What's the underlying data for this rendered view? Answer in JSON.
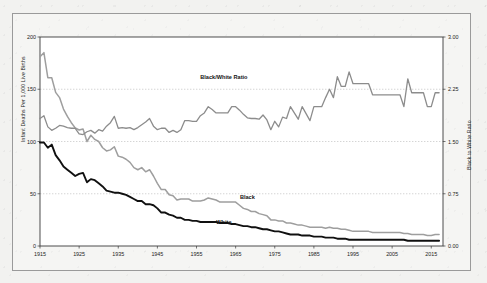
{
  "figure": {
    "background_color": "#f2f2f0",
    "plot_background_color": "#ffffff",
    "frame_color": "#9a9a9a"
  },
  "chart_data": {
    "type": "line",
    "title": "",
    "xlabel": "",
    "ylabel": "Infant Deaths Per 1,000 Live Births",
    "y2label": "Black to White Ratio",
    "xlim": [
      1915,
      2018
    ],
    "ylim": [
      0,
      200
    ],
    "y2lim": [
      0.0,
      3.0
    ],
    "grid": true,
    "grid_style": "dotted-horizontal",
    "legend": "inline-annotations",
    "xticks": [
      1915,
      1925,
      1935,
      1945,
      1955,
      1965,
      1975,
      1985,
      1995,
      2005,
      2015
    ],
    "yticks": [
      0,
      50,
      100,
      150,
      200
    ],
    "y2ticks": [
      "0.00",
      "0.75",
      "1.50",
      "2.25",
      "3.00"
    ],
    "annotations": [
      {
        "text": "Black/White Ratio",
        "x": 1962,
        "y_axis": "right",
        "value": 2.32
      },
      {
        "text": "Black",
        "x": 1968,
        "y_axis": "left",
        "value": 40
      },
      {
        "text": "White",
        "x": 1962,
        "y_axis": "left",
        "value": 16
      }
    ],
    "series": [
      {
        "name": "Black",
        "axis": "left",
        "color": "#9e9e9e",
        "width": 1.5,
        "x": [
          1915,
          1916,
          1917,
          1918,
          1919,
          1920,
          1921,
          1922,
          1923,
          1924,
          1925,
          1926,
          1927,
          1928,
          1929,
          1930,
          1931,
          1932,
          1933,
          1934,
          1935,
          1936,
          1937,
          1938,
          1939,
          1940,
          1941,
          1942,
          1943,
          1944,
          1945,
          1946,
          1947,
          1948,
          1949,
          1950,
          1951,
          1952,
          1953,
          1954,
          1955,
          1956,
          1957,
          1958,
          1959,
          1960,
          1961,
          1962,
          1963,
          1964,
          1965,
          1966,
          1967,
          1968,
          1969,
          1970,
          1971,
          1972,
          1973,
          1974,
          1975,
          1976,
          1977,
          1978,
          1979,
          1980,
          1981,
          1982,
          1983,
          1984,
          1985,
          1986,
          1987,
          1988,
          1989,
          1990,
          1991,
          1992,
          1993,
          1994,
          1995,
          1996,
          1997,
          1998,
          1999,
          2000,
          2001,
          2002,
          2003,
          2004,
          2005,
          2006,
          2007,
          2008,
          2009,
          2010,
          2011,
          2012,
          2013,
          2014,
          2015,
          2016,
          2017
        ],
        "values": [
          181,
          185,
          161,
          161,
          147,
          142,
          131,
          124,
          118,
          113,
          111,
          112,
          100,
          106,
          102,
          100,
          94,
          91,
          92,
          95,
          86,
          85,
          83,
          80,
          75,
          73,
          75,
          71,
          73,
          67,
          60,
          54,
          54,
          49,
          48,
          44,
          45,
          45,
          45,
          43,
          43,
          43,
          44,
          46,
          45,
          44,
          42,
          42,
          42,
          42,
          42,
          39,
          36,
          35,
          33,
          33,
          31,
          30,
          29,
          25,
          25,
          24,
          24,
          22,
          22,
          21,
          20,
          20,
          19,
          18,
          18,
          18,
          18,
          17,
          18,
          17,
          17,
          16,
          16,
          15,
          14,
          14,
          14,
          14,
          14,
          13,
          13,
          13,
          13,
          13,
          13,
          13,
          13,
          12,
          12,
          11,
          11,
          11,
          11,
          10,
          10,
          11,
          11
        ]
      },
      {
        "name": "White",
        "axis": "left",
        "color": "#101010",
        "width": 1.9,
        "x": [
          1915,
          1916,
          1917,
          1918,
          1919,
          1920,
          1921,
          1922,
          1923,
          1924,
          1925,
          1926,
          1927,
          1928,
          1929,
          1930,
          1931,
          1932,
          1933,
          1934,
          1935,
          1936,
          1937,
          1938,
          1939,
          1940,
          1941,
          1942,
          1943,
          1944,
          1945,
          1946,
          1947,
          1948,
          1949,
          1950,
          1951,
          1952,
          1953,
          1954,
          1955,
          1956,
          1957,
          1958,
          1959,
          1960,
          1961,
          1962,
          1963,
          1964,
          1965,
          1966,
          1967,
          1968,
          1969,
          1970,
          1971,
          1972,
          1973,
          1974,
          1975,
          1976,
          1977,
          1978,
          1979,
          1980,
          1981,
          1982,
          1983,
          1984,
          1985,
          1986,
          1987,
          1988,
          1989,
          1990,
          1991,
          1992,
          1993,
          1994,
          1995,
          1996,
          1997,
          1998,
          1999,
          2000,
          2001,
          2002,
          2003,
          2004,
          2005,
          2006,
          2007,
          2008,
          2009,
          2010,
          2011,
          2012,
          2013,
          2014,
          2015,
          2016,
          2017
        ],
        "values": [
          99,
          99,
          94,
          97,
          87,
          82,
          76,
          73,
          70,
          67,
          69,
          70,
          61,
          64,
          63,
          60,
          57,
          53,
          52,
          51,
          51,
          50,
          49,
          47,
          45,
          43,
          43,
          40,
          40,
          39,
          36,
          32,
          32,
          30,
          29,
          27,
          27,
          25,
          25,
          24,
          24,
          23,
          23,
          23,
          23,
          23,
          22,
          22,
          22,
          21,
          21,
          20,
          19,
          19,
          18,
          18,
          17,
          16,
          16,
          15,
          14,
          14,
          13,
          12,
          11,
          11,
          11,
          10,
          10,
          10,
          9,
          9,
          9,
          8,
          8,
          8,
          7,
          7,
          7,
          6,
          6,
          6,
          6,
          6,
          6,
          6,
          6,
          6,
          6,
          6,
          6,
          6,
          6,
          6,
          5,
          5,
          5,
          5,
          5,
          5,
          5,
          5,
          5
        ]
      },
      {
        "name": "Black/White Ratio",
        "axis": "right",
        "color": "#8c8c8c",
        "width": 1.3,
        "x": [
          1915,
          1916,
          1917,
          1918,
          1919,
          1920,
          1921,
          1922,
          1923,
          1924,
          1925,
          1926,
          1927,
          1928,
          1929,
          1930,
          1931,
          1932,
          1933,
          1934,
          1935,
          1936,
          1937,
          1938,
          1939,
          1940,
          1941,
          1942,
          1943,
          1944,
          1945,
          1946,
          1947,
          1948,
          1949,
          1950,
          1951,
          1952,
          1953,
          1954,
          1955,
          1956,
          1957,
          1958,
          1959,
          1960,
          1961,
          1962,
          1963,
          1964,
          1965,
          1966,
          1967,
          1968,
          1969,
          1970,
          1971,
          1972,
          1973,
          1974,
          1975,
          1976,
          1977,
          1978,
          1979,
          1980,
          1981,
          1982,
          1983,
          1984,
          1985,
          1986,
          1987,
          1988,
          1989,
          1990,
          1991,
          1992,
          1993,
          1994,
          1995,
          1996,
          1997,
          1998,
          1999,
          2000,
          2001,
          2002,
          2003,
          2004,
          2005,
          2006,
          2007,
          2008,
          2009,
          2010,
          2011,
          2012,
          2013,
          2014,
          2015,
          2016,
          2017
        ],
        "values": [
          1.83,
          1.87,
          1.71,
          1.66,
          1.69,
          1.73,
          1.72,
          1.7,
          1.69,
          1.69,
          1.61,
          1.6,
          1.64,
          1.66,
          1.62,
          1.67,
          1.65,
          1.72,
          1.77,
          1.86,
          1.69,
          1.7,
          1.69,
          1.7,
          1.67,
          1.7,
          1.74,
          1.78,
          1.83,
          1.72,
          1.67,
          1.69,
          1.69,
          1.63,
          1.66,
          1.63,
          1.67,
          1.8,
          1.8,
          1.79,
          1.79,
          1.87,
          1.91,
          2.0,
          1.96,
          1.91,
          1.91,
          1.91,
          1.91,
          2.0,
          2.0,
          1.95,
          1.89,
          1.84,
          1.83,
          1.83,
          1.82,
          1.88,
          1.81,
          1.67,
          1.79,
          1.71,
          1.85,
          1.83,
          2.0,
          1.91,
          1.82,
          2.0,
          1.9,
          1.8,
          2.0,
          2.0,
          2.0,
          2.13,
          2.25,
          2.13,
          2.43,
          2.29,
          2.29,
          2.5,
          2.33,
          2.33,
          2.33,
          2.33,
          2.33,
          2.17,
          2.17,
          2.17,
          2.17,
          2.17,
          2.17,
          2.17,
          2.17,
          2.0,
          2.4,
          2.2,
          2.2,
          2.2,
          2.2,
          2.0,
          2.0,
          2.2,
          2.2
        ]
      }
    ]
  }
}
